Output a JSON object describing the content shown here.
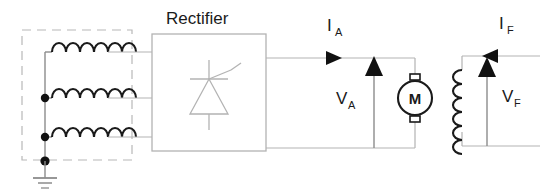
{
  "diagram": {
    "title": "Rectifier",
    "type": "dc-motor-drive-schematic",
    "colors": {
      "wire": "#b3b3b3",
      "component": "#1a1a1a",
      "dashed_box": "#b3b3b3",
      "background": "#ffffff"
    },
    "source": {
      "name": "three-phase-ac-source",
      "phase_count": 3,
      "dashed_enclosure": true,
      "grounded": true,
      "coil_loops": 6
    },
    "rectifier": {
      "label": "Rectifier",
      "symbol": "thyristor",
      "input_phases": 3,
      "output_terminals": 2
    },
    "armature_circuit": {
      "current_label": "I",
      "current_subscript": "A",
      "current_arrow_direction": "right",
      "voltage_label": "V",
      "voltage_subscript": "A",
      "voltage_arrow_direction": "up",
      "motor_symbol": "M"
    },
    "field_circuit": {
      "current_label": "I",
      "current_subscript": "F",
      "current_arrow_direction": "left",
      "voltage_label": "V",
      "voltage_subscript": "F",
      "voltage_arrow_direction": "up",
      "winding_loops": 6
    }
  }
}
